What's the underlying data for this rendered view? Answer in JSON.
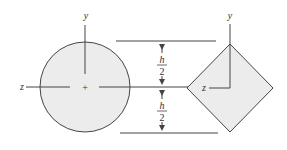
{
  "diagram": {
    "circle_section": {
      "y_axis_label": "y",
      "z_axis_label": "z",
      "centroid_marker": "+"
    },
    "square_section": {
      "y_axis_label": "y",
      "z_axis_label": "z"
    },
    "dimensions": {
      "upper_numerator": "h",
      "upper_denominator": "2",
      "lower_numerator": "h",
      "lower_denominator": "2"
    },
    "colors": {
      "fill": "#ececec",
      "stroke": "#444444"
    }
  }
}
